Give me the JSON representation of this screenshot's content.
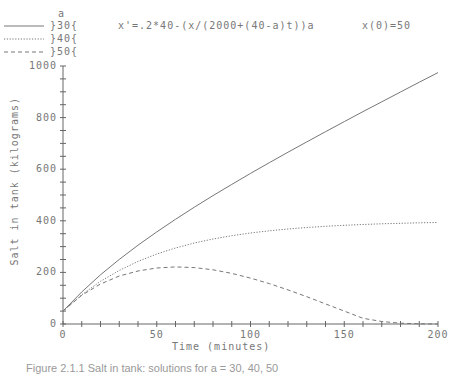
{
  "legend": {
    "header": "a",
    "items": [
      {
        "label": "}30{",
        "style": "solid"
      },
      {
        "label": "}40{",
        "style": "dotted"
      },
      {
        "label": "}50{",
        "style": "dashed"
      }
    ]
  },
  "equation": "x'=.2*40-(x/(2000+(40-a)t))a",
  "initial_condition": "x(0)=50",
  "caption": "Figure 2.1.1 Salt in tank: solutions for a = 30, 40, 50",
  "chart_data": {
    "type": "line",
    "xlabel": "Time (minutes)",
    "ylabel": "Salt in tank (kilograms)",
    "xlim": [
      0,
      200
    ],
    "ylim": [
      0,
      1000
    ],
    "xticks": [
      0,
      50,
      100,
      150,
      200
    ],
    "yticks": [
      0,
      200,
      400,
      600,
      800,
      1000
    ],
    "grid": false,
    "legend_position": "top-left",
    "legend_title": "a",
    "x": [
      0,
      10,
      20,
      30,
      40,
      50,
      60,
      70,
      80,
      90,
      100,
      110,
      120,
      130,
      140,
      150,
      160,
      170,
      180,
      190,
      200
    ],
    "series": [
      {
        "name": "30",
        "style": "solid",
        "values": [
          50,
          124.5,
          190.6,
          250.5,
          305.6,
          357.1,
          405.9,
          452.6,
          497.6,
          541.2,
          583.6,
          625.1,
          665.8,
          705.9,
          745.4,
          784.5,
          823.1,
          861.4,
          899.4,
          937.1,
          974.6
        ]
      },
      {
        "name": "40",
        "style": "dotted",
        "values": [
          50,
          113.4,
          165.4,
          207.9,
          242.7,
          271.3,
          294.6,
          313.8,
          329.5,
          342.3,
          352.6,
          361.3,
          368.3,
          374.0,
          378.8,
          382.6,
          385.7,
          388.3,
          390.4,
          392.2,
          393.6
        ]
      },
      {
        "name": "50",
        "style": "dashed",
        "values": [
          50,
          111.6,
          155.0,
          186.1,
          205.3,
          216.9,
          221.2,
          218.6,
          210.0,
          196.2,
          178.1,
          156.5,
          132.1,
          105.7,
          78.1,
          50.0,
          22.1,
          9.5,
          3.2,
          0.6,
          0
        ]
      }
    ]
  }
}
